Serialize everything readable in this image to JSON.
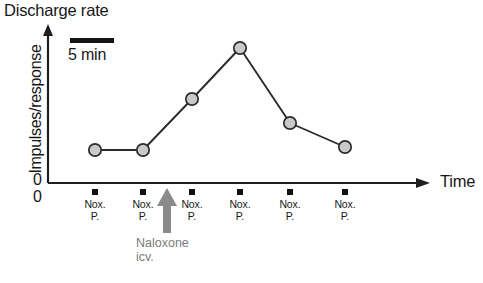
{
  "chart_data": {
    "type": "line",
    "title": "Discharge rate",
    "xlabel": "Time",
    "ylabel": "Impulses/response",
    "x_origin_label": "0",
    "y_origin_label": "0",
    "grid": false,
    "legend": null,
    "axis_style": "arrow-ended, unlabeled ordinal axes",
    "categories": [
      "Nox. P.",
      "Nox. P.",
      "Nox. P.",
      "Nox. P.",
      "Nox. P.",
      "Nox. P."
    ],
    "x": [
      1,
      2,
      3,
      4,
      5,
      6
    ],
    "values": [
      0.22,
      0.22,
      0.62,
      1.0,
      0.45,
      0.25
    ],
    "ylim": [
      0,
      1.15
    ],
    "marker": "filled-gray-circle",
    "marker_fill": "#c9c9c9",
    "marker_stroke": "#2b2b2b",
    "line_color": "#2b2b2b",
    "tick_marker": "black-square",
    "tick_marker_color": "#111111",
    "scalebar": {
      "label": "5 min",
      "bar_color": "#141414"
    },
    "annotations": [
      {
        "name": "naloxone-arrow",
        "line1": "Naloxone",
        "line2": "icv.",
        "color": "#7b7b7b",
        "x_between": [
          2,
          3
        ],
        "direction": "up"
      }
    ],
    "tick_labels": [
      {
        "line1": "Nox.",
        "line2": "P."
      },
      {
        "line1": "Nox.",
        "line2": "P."
      },
      {
        "line1": "Nox.",
        "line2": "P."
      },
      {
        "line1": "Nox.",
        "line2": "P."
      },
      {
        "line1": "Nox.",
        "line2": "P."
      },
      {
        "line1": "Nox.",
        "line2": "P."
      }
    ]
  },
  "geometry": {
    "point_px": [
      {
        "cx": 95,
        "cy": 150
      },
      {
        "cx": 143,
        "cy": 150
      },
      {
        "cx": 192,
        "cy": 99
      },
      {
        "cx": 240,
        "cy": 48
      },
      {
        "cx": 290,
        "cy": 123
      },
      {
        "cx": 345,
        "cy": 147
      }
    ],
    "tick_px": [
      95,
      143,
      192,
      240,
      290,
      345
    ],
    "arrow_px": 167
  }
}
